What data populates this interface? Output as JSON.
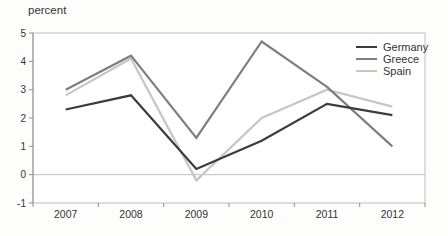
{
  "figure": {
    "unit_label": "percent"
  },
  "chart_data": {
    "type": "line",
    "title": "",
    "xlabel": "",
    "ylabel": "percent",
    "categories": [
      "2007",
      "2008",
      "2009",
      "2010",
      "2011",
      "2012"
    ],
    "series": [
      {
        "name": "Germany",
        "color": "#3b3b3b",
        "values": [
          2.3,
          2.8,
          0.2,
          1.2,
          2.5,
          2.1
        ]
      },
      {
        "name": "Greece",
        "color": "#7e7e7e",
        "values": [
          3.0,
          4.2,
          1.3,
          4.7,
          3.1,
          1.0
        ]
      },
      {
        "name": "Spain",
        "color": "#c6c6c6",
        "values": [
          2.8,
          4.1,
          -0.2,
          2.0,
          3.0,
          2.4
        ]
      }
    ],
    "ylim": [
      -1,
      5
    ],
    "yticks": [
      5,
      4,
      3,
      2,
      1,
      0,
      -1
    ],
    "grid": "zero-line-only",
    "legend_position": "top-right",
    "colors": {
      "frame": "#bdbdbd",
      "axis": "#8f8f8f",
      "text": "#333333",
      "plot_background": "#ffffff"
    }
  }
}
